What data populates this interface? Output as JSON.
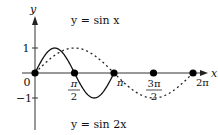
{
  "chart_data": {
    "type": "line",
    "title": "",
    "xlabel": "x",
    "ylabel": "y",
    "xlim": [
      0,
      6.2832
    ],
    "ylim": [
      -1,
      1
    ],
    "grid": false,
    "x_ticks": [
      "0",
      "π/2",
      "π",
      "3π/2",
      "2π"
    ],
    "x_tick_values": [
      0,
      1.5708,
      3.1416,
      4.7124,
      6.2832
    ],
    "y_ticks": [
      "1",
      "−1"
    ],
    "y_tick_values": [
      1,
      -1
    ],
    "series": [
      {
        "name": "y = sin x",
        "style": "dashed",
        "x": [
          0,
          0.7854,
          1.5708,
          2.3562,
          3.1416,
          3.927,
          4.7124,
          5.4978,
          6.2832
        ],
        "values": [
          0,
          0.707,
          1,
          0.707,
          0,
          -0.707,
          -1,
          -0.707,
          0
        ]
      },
      {
        "name": "y = sin 2x",
        "style": "solid",
        "x": [
          0,
          0.3927,
          0.7854,
          1.1781,
          1.5708,
          1.9635,
          2.3562,
          2.7489,
          3.1416
        ],
        "values": [
          0,
          0.707,
          1,
          0.707,
          0,
          -0.707,
          -1,
          -0.707,
          0
        ]
      }
    ],
    "marked_points": [
      {
        "x": "0",
        "y": 0
      },
      {
        "x": "π/2",
        "y": 0
      },
      {
        "x": "π",
        "y": 0
      },
      {
        "x": "3π/2",
        "y": 0
      },
      {
        "x": "2π",
        "y": 0
      }
    ],
    "annotations": [
      "y = sin x",
      "y = sin 2x"
    ]
  },
  "labels": {
    "y_axis": "y",
    "x_axis": "x",
    "origin": "0",
    "y_pos1": "1",
    "y_neg1": "−1",
    "pi_half_num": "π",
    "pi_half_den": "2",
    "pi": "π",
    "three_pi_half_num": "3π",
    "three_pi_half_den": "2",
    "two_pi": "2π",
    "sin_x_label": "y = sin x",
    "sin_2x_label": "y = sin 2x"
  }
}
